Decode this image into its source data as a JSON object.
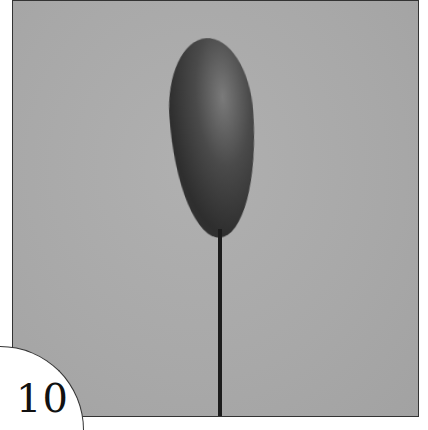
{
  "figure": {
    "number_label": "10",
    "background_color": "#a9a9a9",
    "object_color": "#333333",
    "frame_border_color": "#333333"
  }
}
